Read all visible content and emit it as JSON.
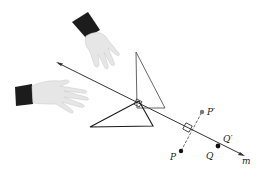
{
  "figure": {
    "colors": {
      "line": "#333333",
      "triangle_image": "#555555",
      "triangle_original": "#1a1a1a",
      "point": "#111111",
      "point_image": "#777777",
      "cuff": "#1c1c1c",
      "hand": "#e4e4e4"
    },
    "labels": {
      "line": "m",
      "point_p": "P",
      "point_p_prime": "P′",
      "point_q": "Q",
      "point_q_prime": "Q′"
    }
  }
}
